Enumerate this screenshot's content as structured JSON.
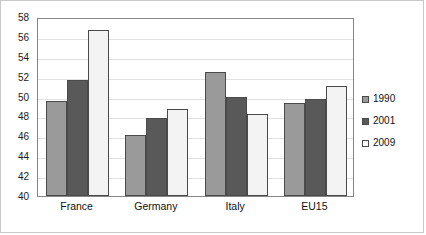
{
  "chart_data": {
    "type": "bar",
    "title": "",
    "subtitle": "",
    "xlabel": "",
    "ylabel": "",
    "categories": [
      "France",
      "Germany",
      "Italy",
      "EU15"
    ],
    "series": [
      {
        "name": "1990",
        "color": "#9a9a9a",
        "values": [
          49.6,
          46.1,
          52.5,
          49.4
        ]
      },
      {
        "name": "2001",
        "color": "#595959",
        "values": [
          51.7,
          47.8,
          50.0,
          49.8
        ]
      },
      {
        "name": "2009",
        "color": "#f3f3f3",
        "values": [
          56.7,
          48.7,
          48.2,
          51.1
        ]
      }
    ],
    "ylim": [
      40,
      58
    ],
    "ytick_values": [
      40,
      42,
      44,
      46,
      48,
      50,
      52,
      54,
      56,
      58
    ],
    "ytick_labels": [
      "40",
      "42",
      "44",
      "46",
      "48",
      "50",
      "52",
      "54",
      "56",
      "58"
    ],
    "grid": true,
    "grid_axis": "y",
    "legend_position": "right",
    "legend_entries": [
      "1990",
      "2001",
      "2009"
    ]
  }
}
